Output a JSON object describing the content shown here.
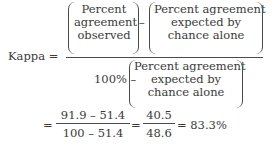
{
  "formula": {
    "lhs": "Kappa =",
    "numerator": {
      "term1": [
        "Percent",
        "agreement",
        "observed"
      ],
      "minus": "–",
      "term2": [
        "Percent agreement",
        "expected by",
        "chance alone"
      ]
    },
    "denominator": {
      "prefix": "100% –",
      "term": [
        "Percent agreement",
        "expected by",
        "chance alone"
      ]
    },
    "calc": {
      "eq1": "=",
      "frac1_num": "91.9 – 51.4",
      "frac1_den": "100 – 51.4",
      "eq2": "=",
      "frac2_num": "40.5",
      "frac2_den": "48.6",
      "result": "= 83.3%"
    }
  }
}
